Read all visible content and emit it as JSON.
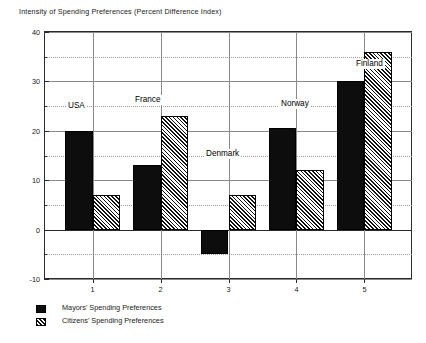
{
  "chart_data": {
    "type": "bar",
    "title": "Intensity  of Spending Preferences (Percent Difference Index)",
    "xlabel": "",
    "ylabel": "",
    "ylim": [
      -10,
      40
    ],
    "xlim": [
      0.3,
      5.7
    ],
    "grid": true,
    "y_ticks_major": [
      40,
      30,
      20,
      10,
      0,
      -10
    ],
    "y_ticks_minor": [
      35,
      25,
      15,
      5,
      -5
    ],
    "y_tick_labels": [
      "40",
      "30",
      "20",
      "10",
      "0",
      "-10"
    ],
    "categories": [
      "1",
      "2",
      "3",
      "4",
      "5"
    ],
    "category_names": [
      "USA",
      "France",
      "Denmark",
      "Norway",
      "Finland"
    ],
    "legend_position": "below-left",
    "series": [
      {
        "name": "Mayors' Spending Preferences",
        "fill": "solid",
        "color": "#0d0d0d",
        "values": [
          20,
          13,
          -5,
          20.5,
          30
        ]
      },
      {
        "name": "Citizens' Spending Preferences",
        "fill": "hatched",
        "color": "#111111",
        "values": [
          7,
          23,
          7,
          12,
          36
        ]
      }
    ],
    "annotations": [
      {
        "text": "USA",
        "x_px": 66,
        "y_px": 101
      },
      {
        "text": "France",
        "x_px": 133,
        "y_px": 95
      },
      {
        "text": "Denmark",
        "x_px": 204,
        "y_px": 149
      },
      {
        "text": "Norway",
        "x_px": 279,
        "y_px": 99
      },
      {
        "text": "Finland",
        "x_px": 354,
        "y_px": 59
      }
    ]
  },
  "legend": {
    "items": [
      {
        "label": "Mayors' Spending Preferences",
        "swatch": "solid"
      },
      {
        "label": "Citizens' Spending Preferences",
        "swatch": "hatched"
      }
    ]
  }
}
